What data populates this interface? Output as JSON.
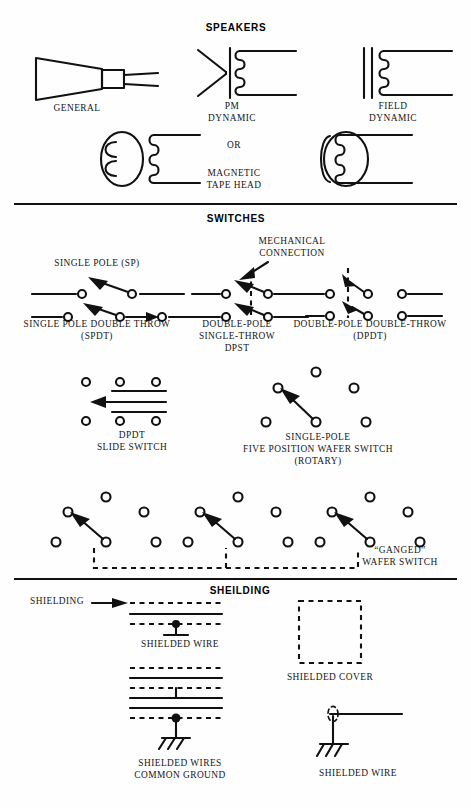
{
  "page": {
    "background": "#fefefe",
    "ink": "#111111"
  },
  "sections": [
    {
      "id": "speakers",
      "heading": "SPEAKERS",
      "items": [
        {
          "id": "general",
          "label": "GENERAL",
          "lines": [
            "GENERAL"
          ]
        },
        {
          "id": "pm-dynamic",
          "label": "PM DYNAMIC",
          "lines": [
            "PM",
            "DYNAMIC"
          ]
        },
        {
          "id": "field-dynamic",
          "label": "FIELD DYNAMIC",
          "lines": [
            "FIELD",
            "DYNAMIC"
          ]
        },
        {
          "id": "or-connector",
          "label": "OR",
          "lines": [
            "OR"
          ]
        },
        {
          "id": "tape-head",
          "label": "MAGNETIC TAPE HEAD",
          "lines": [
            "MAGNETIC",
            "TAPE HEAD"
          ]
        }
      ]
    },
    {
      "id": "switches",
      "heading": "SWITCHES",
      "items": [
        {
          "id": "sp",
          "label": "SINGLE POLE (SP)",
          "lines": [
            "SINGLE POLE (SP)"
          ]
        },
        {
          "id": "spdt",
          "label": "SINGLE POLE DOUBLE THROW (SPDT)",
          "lines": [
            "SINGLE POLE DOUBLE THROW",
            "(SPDT)"
          ]
        },
        {
          "id": "mech-conn",
          "label": "MECHANICAL CONNECTION",
          "lines": [
            "MECHANICAL",
            "CONNECTION"
          ]
        },
        {
          "id": "dpst",
          "label": "DOUBLE-POLE SINGLE-THROW DPST",
          "lines": [
            "DOUBLE-POLE",
            "SINGLE-THROW",
            "DPST"
          ]
        },
        {
          "id": "dpdt",
          "label": "DOUBLE-POLE DOUBLE-THROW (DPDT)",
          "lines": [
            "DOUBLE-POLE DOUBLE-THROW",
            "(DPDT)"
          ]
        },
        {
          "id": "slide",
          "label": "DPDT SLIDE SWITCH",
          "lines": [
            "DPDT",
            "SLIDE SWITCH"
          ]
        },
        {
          "id": "wafer",
          "label": "SINGLE-POLE FIVE POSITION WAFER SWITCH (ROTARY)",
          "lines": [
            "SINGLE-POLE",
            "FIVE POSITION WAFER SWITCH",
            "(ROTARY)"
          ]
        },
        {
          "id": "ganged",
          "label": "GANGED WAFER SWITCH",
          "lines": [
            "“GANGED”",
            "WAFER SWITCH"
          ]
        }
      ]
    },
    {
      "id": "shielding",
      "heading": "SHEILDING",
      "items": [
        {
          "id": "shielding-callout",
          "label": "SHIELDING",
          "lines": [
            "SHIELDING"
          ]
        },
        {
          "id": "shielded-wire-1",
          "label": "SHIELDED WIRE",
          "lines": [
            "SHIELDED WIRE"
          ]
        },
        {
          "id": "shielded-cover",
          "label": "SHIELDED COVER",
          "lines": [
            "SHIELDED COVER"
          ]
        },
        {
          "id": "shielded-wires-cg",
          "label": "SHIELDED WIRES COMMON GROUND",
          "lines": [
            "SHIELDED WIRES",
            "COMMON GROUND"
          ]
        },
        {
          "id": "shielded-wire-2",
          "label": "SHIELDED WIRE",
          "lines": [
            "SHIELDED WIRE"
          ]
        }
      ]
    }
  ]
}
